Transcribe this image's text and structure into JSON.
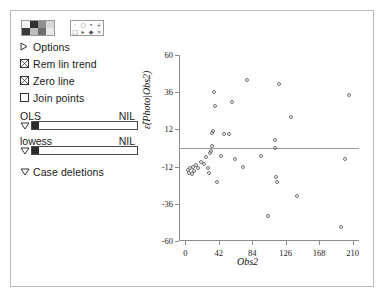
{
  "window": {
    "title": ""
  },
  "panel": {
    "color_palette": {
      "name": "color-palette",
      "colors": [
        "#f2f2f2",
        "#2f2f2f",
        "#8f8f8f",
        "#d8d8d8",
        "#3a3a3a",
        "#bdbdbd",
        "#6e6e6e",
        "#e8e8e8"
      ]
    },
    "symbol_palette": {
      "name": "symbol-palette",
      "symbols": [
        "·",
        "○",
        "•",
        "+",
        "□",
        "▸",
        "◆",
        "×"
      ]
    },
    "menu": [
      {
        "label": "Options",
        "glyph": "triangle-right",
        "checked": null
      },
      {
        "label": "Rem lin trend",
        "glyph": "checkbox",
        "checked": true
      },
      {
        "label": "Zero line",
        "glyph": "checkbox",
        "checked": true
      },
      {
        "label": "Join points",
        "glyph": "checkbox",
        "checked": false
      }
    ],
    "sliders": [
      {
        "label": "OLS",
        "value": "NIL"
      },
      {
        "label": "lowess",
        "value": "NIL"
      }
    ],
    "case_deletions": {
      "label": "Case deletions",
      "glyph": "triangle-down"
    }
  },
  "chart_data": {
    "type": "scatter",
    "title": "",
    "xlabel": "Obs2",
    "ylabel": "ε̂(Photo|Obs2)",
    "xlim": [
      -8,
      218
    ],
    "ylim": [
      -60,
      60
    ],
    "xticks": [
      0,
      42,
      84,
      126,
      168,
      210
    ],
    "yticks": [
      -60,
      -36,
      -12,
      12,
      36,
      60
    ],
    "grid": false,
    "legend": null,
    "zero_line": 0,
    "marker": "open-circle",
    "marker_color": "#6f6f6f",
    "points": [
      {
        "x": 3,
        "y": -14
      },
      {
        "x": 5,
        "y": -16
      },
      {
        "x": 6,
        "y": -13
      },
      {
        "x": 8,
        "y": -17
      },
      {
        "x": 9,
        "y": -12
      },
      {
        "x": 11,
        "y": -15
      },
      {
        "x": 13,
        "y": -11
      },
      {
        "x": 16,
        "y": -13
      },
      {
        "x": 20,
        "y": -9
      },
      {
        "x": 23,
        "y": -10
      },
      {
        "x": 26,
        "y": -6
      },
      {
        "x": 28,
        "y": -13
      },
      {
        "x": 30,
        "y": -16
      },
      {
        "x": 31,
        "y": -3
      },
      {
        "x": 32,
        "y": -2
      },
      {
        "x": 33,
        "y": 1
      },
      {
        "x": 34,
        "y": 10
      },
      {
        "x": 35,
        "y": 11
      },
      {
        "x": 36,
        "y": 36
      },
      {
        "x": 37,
        "y": 27
      },
      {
        "x": 40,
        "y": -22
      },
      {
        "x": 45,
        "y": -5
      },
      {
        "x": 48,
        "y": 9
      },
      {
        "x": 55,
        "y": 9
      },
      {
        "x": 58,
        "y": 30
      },
      {
        "x": 62,
        "y": -7
      },
      {
        "x": 72,
        "y": -12
      },
      {
        "x": 78,
        "y": 44
      },
      {
        "x": 95,
        "y": -5
      },
      {
        "x": 104,
        "y": -44
      },
      {
        "x": 112,
        "y": 5
      },
      {
        "x": 113,
        "y": 0
      },
      {
        "x": 114,
        "y": -19
      },
      {
        "x": 115,
        "y": -22
      },
      {
        "x": 118,
        "y": 41
      },
      {
        "x": 132,
        "y": 20
      },
      {
        "x": 140,
        "y": -31
      },
      {
        "x": 196,
        "y": -51
      },
      {
        "x": 200,
        "y": -7
      },
      {
        "x": 205,
        "y": 34
      }
    ]
  }
}
